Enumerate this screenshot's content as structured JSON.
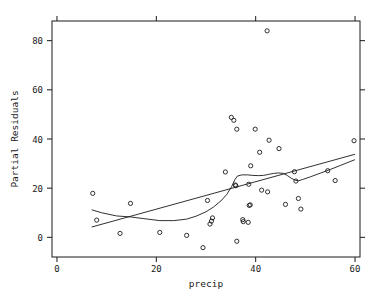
{
  "chart_data": {
    "type": "scatter",
    "title": "",
    "xlabel": "precip",
    "ylabel": "Partial Residuals",
    "xlim": [
      -1.0,
      61.0
    ],
    "ylim": [
      -8.0,
      88.0
    ],
    "grid": false,
    "legend": null,
    "xticks": [
      0,
      20,
      40,
      60
    ],
    "xticklabels": [
      "0",
      "20",
      "40",
      "60"
    ],
    "yticks": [
      0,
      20,
      40,
      60,
      80
    ],
    "yticklabels": [
      "0",
      "20",
      "40",
      "60",
      "80"
    ],
    "marker": "open-circle",
    "marker_color": "#1a1a1a",
    "line_color": "#1a1a1a",
    "points": [
      [
        7.2,
        17.9
      ],
      [
        8.0,
        7.0
      ],
      [
        12.7,
        1.6
      ],
      [
        14.8,
        13.8
      ],
      [
        20.7,
        2.0
      ],
      [
        26.1,
        0.8
      ],
      [
        29.4,
        -4.2
      ],
      [
        30.3,
        15.0
      ],
      [
        30.8,
        5.4
      ],
      [
        31.1,
        6.6
      ],
      [
        31.3,
        7.9
      ],
      [
        33.9,
        26.6
      ],
      [
        35.1,
        48.8
      ],
      [
        35.6,
        47.6
      ],
      [
        35.9,
        21.3
      ],
      [
        36.0,
        21.0
      ],
      [
        36.2,
        44.0
      ],
      [
        36.2,
        -1.6
      ],
      [
        37.4,
        7.2
      ],
      [
        37.5,
        6.4
      ],
      [
        38.5,
        6.1
      ],
      [
        38.6,
        21.6
      ],
      [
        38.7,
        13.0
      ],
      [
        38.9,
        13.2
      ],
      [
        39.0,
        29.1
      ],
      [
        39.9,
        44.0
      ],
      [
        40.8,
        34.6
      ],
      [
        41.2,
        19.2
      ],
      [
        42.3,
        84.0
      ],
      [
        42.4,
        18.5
      ],
      [
        42.7,
        39.5
      ],
      [
        44.7,
        36.1
      ],
      [
        46.0,
        13.4
      ],
      [
        47.8,
        26.7
      ],
      [
        48.1,
        22.9
      ],
      [
        48.6,
        15.8
      ],
      [
        49.1,
        11.5
      ],
      [
        54.5,
        27.1
      ],
      [
        56.0,
        23.1
      ],
      [
        59.8,
        39.3
      ]
    ],
    "series": [
      {
        "name": "linear-fit",
        "type": "line",
        "x": [
          7.0,
          60.0
        ],
        "y": [
          4.2,
          33.8
        ]
      },
      {
        "name": "lowess-fit",
        "type": "line",
        "x": [
          7.0,
          9.0,
          12.0,
          14.8,
          17.5,
          20.7,
          23.5,
          26.1,
          28.0,
          30.0,
          31.5,
          33.0,
          34.2,
          35.2,
          35.8,
          36.3,
          37.2,
          38.4,
          39.3,
          40.6,
          41.6,
          42.6,
          43.6,
          44.6,
          45.6,
          46.4,
          47.2,
          48.0,
          48.6,
          49.4,
          51.0,
          53.0,
          55.0,
          57.0,
          58.6,
          60.0
        ],
        "y": [
          11.2,
          10.0,
          8.7,
          8.3,
          7.6,
          6.8,
          6.8,
          7.4,
          8.6,
          10.4,
          12.3,
          14.8,
          17.5,
          20.8,
          23.4,
          24.9,
          25.4,
          25.4,
          25.2,
          25.1,
          25.2,
          25.6,
          26.0,
          26.2,
          26.0,
          25.1,
          24.0,
          23.2,
          23.0,
          23.5,
          24.6,
          26.1,
          27.6,
          29.2,
          30.5,
          31.6
        ]
      }
    ]
  }
}
